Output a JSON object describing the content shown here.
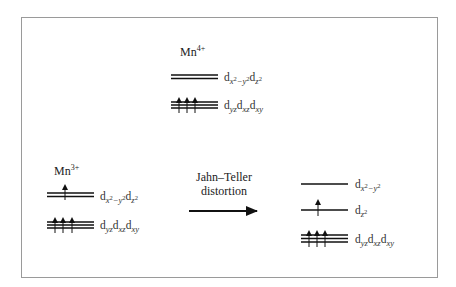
{
  "diagram": {
    "colors": {
      "line": "#111111",
      "frame": "#9a9a9a",
      "text": "#222222"
    },
    "mn4": {
      "ion": "Mn",
      "charge": "4+",
      "levels": [
        {
          "name": "eg",
          "label": "dx2-y2 dz2",
          "lines": 2,
          "electrons": 0
        },
        {
          "name": "t2g",
          "label": "dyz dxz dxy",
          "lines": 3,
          "electrons": 3
        }
      ]
    },
    "mn3": {
      "ion": "Mn",
      "charge": "3+",
      "levels": [
        {
          "name": "eg",
          "label": "dx2-y2 dz2",
          "lines": 2,
          "electrons": 1
        },
        {
          "name": "t2g",
          "label": "dyz dxz dxy",
          "lines": 3,
          "electrons": 3
        }
      ]
    },
    "transition": {
      "line1": "Jahn–Teller",
      "line2": "distortion",
      "arrow": "right-arrow"
    },
    "distorted": {
      "levels": [
        {
          "name": "dx2-y2",
          "label": "dx2-y2",
          "lines": 1,
          "electrons": 0
        },
        {
          "name": "dz2",
          "label": "dz2",
          "lines": 1,
          "electrons": 1
        },
        {
          "name": "t2g",
          "label": "dyz dxz dxy",
          "lines": 3,
          "electrons": 3
        }
      ]
    },
    "text": {
      "d": "d",
      "x": "x",
      "y": "y",
      "z": "z",
      "two": "2",
      "minus": "−",
      "yz": "yz",
      "xz": "xz",
      "xy": "xy"
    }
  }
}
